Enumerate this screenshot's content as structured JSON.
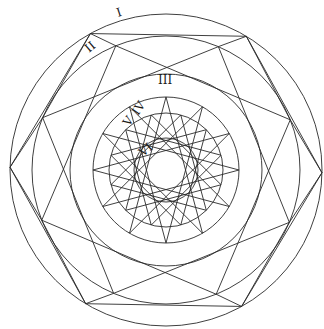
{
  "diagram": {
    "type": "concentric geometric construction",
    "center": [
      166,
      170
    ],
    "stroke_color": "#2a2a2a",
    "background": "#ffffff",
    "circles": [
      {
        "label": "I",
        "r": 156
      },
      {
        "label": "II",
        "r": 134
      },
      {
        "label": "III",
        "r": 96
      },
      {
        "label": "IV",
        "r": 73
      },
      {
        "label": "V",
        "r": 57
      },
      {
        "label": "VI",
        "r": 32
      }
    ],
    "labels": [
      {
        "text": "I",
        "x": 118,
        "y": 17,
        "rotate": -18
      },
      {
        "text": "II",
        "x": 89,
        "y": 53,
        "rotate": -40
      },
      {
        "text": "III",
        "x": 158,
        "y": 84,
        "rotate": 0
      },
      {
        "text": "IV",
        "x": 138,
        "y": 116,
        "rotate": -55
      },
      {
        "text": "V",
        "x": 129,
        "y": 127,
        "rotate": -55
      },
      {
        "text": "VI",
        "x": 143,
        "y": 157,
        "rotate": -40
      }
    ],
    "hexagon": {
      "inscribed_in": "I",
      "start_angle_deg": -119,
      "sides": 6
    },
    "octagram": {
      "inscribed_in": "II",
      "start_angle_deg": -112,
      "points": 8,
      "step": 2
    },
    "star12": {
      "inscribed_in": "IV",
      "start_angle_deg": -90,
      "points": 12,
      "step": 5
    }
  }
}
